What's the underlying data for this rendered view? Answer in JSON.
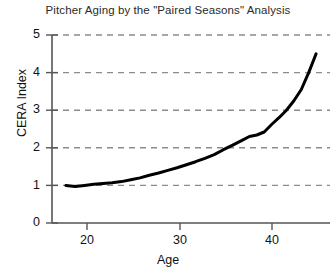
{
  "chart_data": {
    "type": "line",
    "title": "Pitcher Aging by the \"Paired Seasons\" Analysis",
    "xlabel": "Age",
    "ylabel": "CERA Index",
    "xlim": [
      16.5,
      46.5
    ],
    "ylim": [
      0,
      5
    ],
    "xticks": [
      20,
      30,
      40
    ],
    "xtick_labels": [
      "20",
      "30",
      "40"
    ],
    "yticks": [
      0,
      1,
      2,
      3,
      4,
      5
    ],
    "ytick_labels": [
      "0",
      "1",
      "2",
      "3",
      "4",
      "5"
    ],
    "grid": "horizontal-dashed",
    "grid_color": "#8c8c8c",
    "legend": "none",
    "line_color": "#000000",
    "line_width": 3,
    "series": [
      {
        "name": "CERA Index",
        "x": [
          18.0,
          19.0,
          20.0,
          21.0,
          22.0,
          23.0,
          24.0,
          25.0,
          26.0,
          27.0,
          28.0,
          29.0,
          30.0,
          31.0,
          32.0,
          33.0,
          34.0,
          35.0,
          36.0,
          37.0,
          37.8,
          38.6,
          39.4,
          40.2,
          41.0,
          41.8,
          42.6,
          43.4,
          44.2,
          45.0
        ],
        "values": [
          1.0,
          0.97,
          1.0,
          1.03,
          1.05,
          1.07,
          1.1,
          1.15,
          1.2,
          1.27,
          1.33,
          1.4,
          1.47,
          1.55,
          1.63,
          1.72,
          1.82,
          1.95,
          2.07,
          2.2,
          2.3,
          2.34,
          2.42,
          2.62,
          2.8,
          3.0,
          3.25,
          3.55,
          4.0,
          4.5
        ]
      }
    ]
  },
  "axes": {
    "title": "Pitcher Aging by the \"Paired Seasons\" Analysis",
    "y_title": "CERA Index",
    "x_title": "Age",
    "y_labels": [
      "5",
      "4",
      "3",
      "2",
      "1",
      "0"
    ],
    "x_labels": [
      "20",
      "30",
      "40"
    ]
  }
}
